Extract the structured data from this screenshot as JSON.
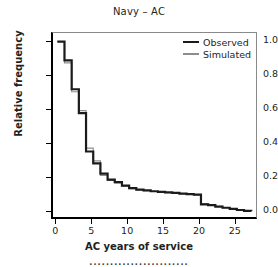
{
  "chart_data": {
    "type": "line",
    "title": "Navy – AC",
    "xlabel": "AC years of service",
    "ylabel": "Relative frequency",
    "xlim": [
      -0.6,
      27.8
    ],
    "ylim": [
      -0.035,
      1.05
    ],
    "xticks": [
      0,
      5,
      10,
      15,
      20,
      25
    ],
    "xtick_labels": [
      "0",
      "5",
      "10",
      "15",
      "20",
      "25"
    ],
    "yticks": [
      0.0,
      0.2,
      0.4,
      0.6,
      0.8,
      1.0
    ],
    "ytick_labels": [
      "0.0",
      "0.2",
      "0.4",
      "0.6",
      "0.8",
      "1.0"
    ],
    "grid": false,
    "legend_position": "top-right",
    "style": "step-post",
    "series": [
      {
        "name": "Observed",
        "color": "#1b1b1b",
        "linewidth": 2.2,
        "x": [
          0,
          1,
          2,
          3,
          4,
          5,
          6,
          7,
          8,
          9,
          10,
          11,
          12,
          13,
          14,
          15,
          16,
          17,
          18,
          19,
          20,
          21,
          22,
          23,
          24,
          25,
          26,
          27
        ],
        "y": [
          1.0,
          0.89,
          0.72,
          0.58,
          0.355,
          0.285,
          0.225,
          0.19,
          0.175,
          0.155,
          0.14,
          0.132,
          0.127,
          0.122,
          0.118,
          0.115,
          0.112,
          0.108,
          0.105,
          0.102,
          0.045,
          0.04,
          0.032,
          0.025,
          0.018,
          0.012,
          0.007,
          0.004
        ]
      },
      {
        "name": "Simulated",
        "color": "#8d8d8d",
        "linewidth": 1.1,
        "x": [
          0,
          1,
          2,
          3,
          4,
          5,
          6,
          7,
          8,
          9,
          10,
          11,
          12,
          13,
          14,
          15,
          16,
          17,
          18,
          19,
          20,
          21,
          22,
          23,
          24,
          25,
          26,
          27
        ],
        "y": [
          1.0,
          0.875,
          0.705,
          0.595,
          0.375,
          0.3,
          0.215,
          0.185,
          0.17,
          0.152,
          0.137,
          0.13,
          0.125,
          0.12,
          0.116,
          0.113,
          0.11,
          0.107,
          0.104,
          0.1,
          0.05,
          0.042,
          0.034,
          0.026,
          0.019,
          0.013,
          0.008,
          0.005
        ]
      }
    ]
  },
  "legend": {
    "items": [
      {
        "label": "Observed"
      },
      {
        "label": "Simulated"
      }
    ]
  },
  "footer": {
    "clipped_text": "························"
  }
}
